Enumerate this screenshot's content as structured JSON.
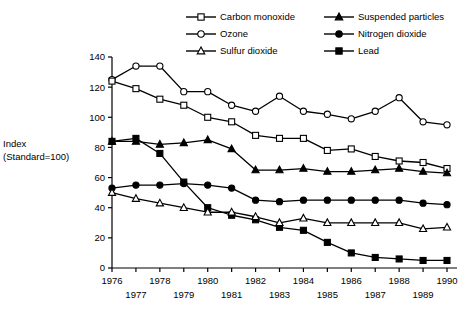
{
  "axis_title_line1": "Index",
  "axis_title_line2": "(Standard=100)",
  "legend": [
    {
      "label": "Carbon monoxide",
      "marker": "open-square",
      "name": "legend-item-carbon-monoxide"
    },
    {
      "label": "Suspended particles",
      "marker": "filled-triangle",
      "name": "legend-item-suspended-particles"
    },
    {
      "label": "Ozone",
      "marker": "open-circle",
      "name": "legend-item-ozone"
    },
    {
      "label": "Nitrogen dioxide",
      "marker": "filled-circle",
      "name": "legend-item-nitrogen-dioxide"
    },
    {
      "label": "Sulfur dioxide",
      "marker": "open-triangle",
      "name": "legend-item-sulfur-dioxide"
    },
    {
      "label": "Lead",
      "marker": "filled-square",
      "name": "legend-item-lead"
    }
  ],
  "chart_data": {
    "type": "line",
    "title": "",
    "xlabel": "",
    "ylabel": "Index (Standard=100)",
    "ylim": [
      0,
      140
    ],
    "yticks": [
      0,
      20,
      40,
      60,
      80,
      100,
      120,
      140
    ],
    "grid": false,
    "legend_position": "top",
    "x": [
      1976,
      1977,
      1978,
      1979,
      1980,
      1981,
      1982,
      1983,
      1984,
      1985,
      1986,
      1987,
      1988,
      1989,
      1990
    ],
    "xticklabels_top": [
      "1976",
      "",
      "1978",
      "",
      "1980",
      "",
      "1982",
      "",
      "1984",
      "",
      "1986",
      "",
      "1988",
      "",
      "1990"
    ],
    "xticklabels_bottom": [
      "",
      "1977",
      "",
      "1979",
      "",
      "1981",
      "",
      "1983",
      "",
      "1985",
      "",
      "1987",
      "",
      "1989",
      ""
    ],
    "series": [
      {
        "name": "Ozone",
        "marker": "open-circle",
        "values": [
          125,
          134,
          134,
          117,
          117,
          108,
          104,
          114,
          104,
          102,
          99,
          104,
          113,
          97,
          95
        ]
      },
      {
        "name": "Carbon monoxide",
        "marker": "open-square",
        "values": [
          124,
          119,
          112,
          108,
          100,
          97,
          88,
          86,
          86,
          78,
          79,
          74,
          71,
          70,
          66
        ]
      },
      {
        "name": "Suspended particles",
        "marker": "filled-triangle",
        "values": [
          84,
          84,
          82,
          83,
          85,
          79,
          65,
          65,
          66,
          64,
          64,
          65,
          66,
          64,
          63
        ]
      },
      {
        "name": "Lead",
        "marker": "filled-square",
        "values": [
          84,
          86,
          76,
          57,
          40,
          35,
          32,
          27,
          25,
          17,
          10,
          7,
          6,
          5,
          5
        ]
      },
      {
        "name": "Nitrogen dioxide",
        "marker": "filled-circle",
        "values": [
          53,
          55,
          55,
          56,
          55,
          53,
          45,
          44,
          45,
          45,
          45,
          45,
          45,
          43,
          42
        ]
      },
      {
        "name": "Sulfur dioxide",
        "marker": "open-triangle",
        "values": [
          50,
          46,
          43,
          40,
          37,
          37,
          34,
          30,
          33,
          30,
          30,
          30,
          30,
          26,
          27
        ]
      }
    ]
  }
}
